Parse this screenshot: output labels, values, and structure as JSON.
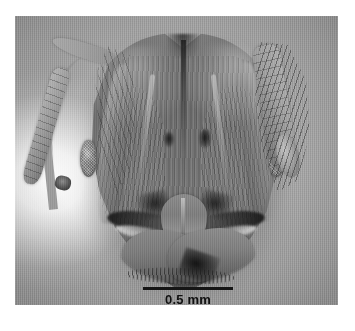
{
  "figure": {
    "domain": "scientific-micrograph",
    "rendering": "grayscale photomicrograph",
    "plate": {
      "background_color": "#a9a9a9",
      "page_color": "#ffffff",
      "left": 15,
      "top": 16,
      "width": 323,
      "height": 289
    }
  },
  "scale_bar": {
    "label": "0.5 mm",
    "length_px": 90,
    "line_color": "#151515",
    "text_color": "#101010"
  },
  "specimen": {
    "parts": [
      {
        "name": "head-capsule",
        "label": "head"
      },
      {
        "name": "vertex-notch",
        "label": "occipital notch"
      },
      {
        "name": "median-furrow",
        "label": "median longitudinal furrow"
      },
      {
        "name": "occipital-lobe-left",
        "label": "left occipital lobe"
      },
      {
        "name": "occipital-lobe-right",
        "label": "right occipital lobe"
      },
      {
        "name": "frontal-carina-left",
        "label": "left frontal carina"
      },
      {
        "name": "frontal-carina-right",
        "label": "right frontal carina"
      },
      {
        "name": "compound-eye-left",
        "label": "left compound eye"
      },
      {
        "name": "compound-eye-right",
        "label": "right compound eye"
      },
      {
        "name": "clypeus",
        "label": "clypeus"
      },
      {
        "name": "mandible-left",
        "label": "left mandible"
      },
      {
        "name": "mandible-right",
        "label": "right mandible"
      },
      {
        "name": "antennal-scape-left",
        "label": "left antennal scape"
      },
      {
        "name": "antennal-scape-right",
        "label": "right antennal scape"
      },
      {
        "name": "setae",
        "label": "setae / hairs"
      }
    ]
  },
  "colors": {
    "plate_background": "#a9a9a9",
    "cuticle_mid": "#7c7c7c",
    "cuticle_dark": "#4a4a4a",
    "cuticle_light": "#c2c2c2",
    "highlight_glow": "#fdfdfd",
    "ink": "#101010"
  }
}
